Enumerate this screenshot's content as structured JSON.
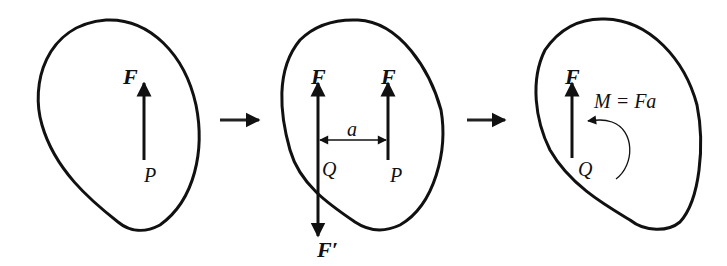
{
  "colors": {
    "stroke": "#111111",
    "background": "#ffffff"
  },
  "panels": [
    {
      "id": "original",
      "labels": {
        "force": "F",
        "point": "P"
      }
    },
    {
      "id": "added-equilibrium-pair",
      "labels": {
        "force_q": "F",
        "force_p": "F",
        "force_prime": "F′",
        "distance": "a",
        "point_q": "Q",
        "point_p": "P"
      }
    },
    {
      "id": "equivalent-force-couple",
      "labels": {
        "force": "F",
        "point": "Q",
        "moment": "M = Fa"
      }
    }
  ],
  "transitions": [
    {
      "from": "original",
      "to": "added-equilibrium-pair",
      "icon": "right-arrow-icon"
    },
    {
      "from": "added-equilibrium-pair",
      "to": "equivalent-force-couple",
      "icon": "right-arrow-icon"
    }
  ]
}
